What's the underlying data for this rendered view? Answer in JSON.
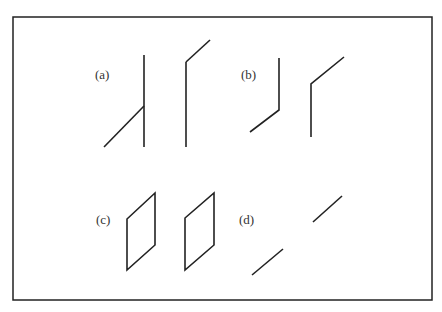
{
  "figure": {
    "frame": {
      "x": 13,
      "y": 17,
      "width": 419,
      "height": 283
    },
    "stroke_color": "#222222",
    "panels": [
      {
        "label": "(a)",
        "label_pos": [
          95,
          67
        ],
        "shapes": [
          {
            "type": "polyline",
            "points": [
              [
                144,
                55
              ],
              [
                144,
                147
              ]
            ]
          },
          {
            "type": "polyline",
            "points": [
              [
                104,
                147
              ],
              [
                144,
                106
              ]
            ]
          },
          {
            "type": "polyline",
            "points": [
              [
                186,
                62
              ],
              [
                186,
                147
              ]
            ]
          },
          {
            "type": "polyline",
            "points": [
              [
                186,
                62
              ],
              [
                210,
                40
              ]
            ]
          }
        ]
      },
      {
        "label": "(b)",
        "label_pos": [
          241,
          67
        ],
        "shapes": [
          {
            "type": "polyline",
            "points": [
              [
                279,
                58
              ],
              [
                279,
                110
              ],
              [
                250,
                132
              ]
            ]
          },
          {
            "type": "polyline",
            "points": [
              [
                311,
                137
              ],
              [
                311,
                84
              ],
              [
                344,
                57
              ]
            ]
          }
        ]
      },
      {
        "label": "(c)",
        "label_pos": [
          96,
          212
        ],
        "shapes": [
          {
            "type": "polygon",
            "points": [
              [
                127,
                219
              ],
              [
                155,
                193
              ],
              [
                155,
                245
              ],
              [
                127,
                270
              ]
            ]
          },
          {
            "type": "polygon",
            "points": [
              [
                185,
                218
              ],
              [
                214,
                193
              ],
              [
                214,
                245
              ],
              [
                185,
                270
              ]
            ]
          }
        ]
      },
      {
        "label": "(d)",
        "label_pos": [
          239,
          212
        ],
        "shapes": [
          {
            "type": "polyline",
            "points": [
              [
                313,
                222
              ],
              [
                342,
                196
              ]
            ]
          },
          {
            "type": "polyline",
            "points": [
              [
                252,
                275
              ],
              [
                283,
                249
              ]
            ]
          }
        ]
      }
    ]
  }
}
